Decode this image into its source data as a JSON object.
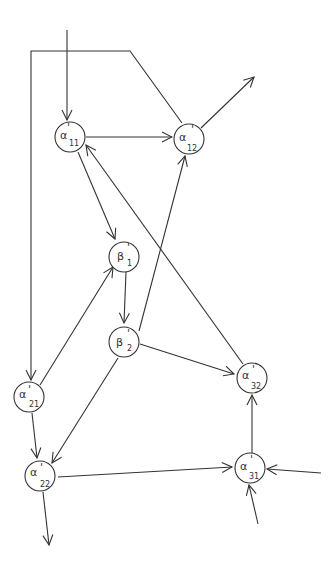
{
  "diagram": {
    "type": "directed-graph",
    "nodes": [
      {
        "id": "a11",
        "symbol": "α",
        "prime": "'",
        "sub": "11",
        "x": 70,
        "y": 137
      },
      {
        "id": "a12",
        "symbol": "α",
        "prime": "'",
        "sub": "12",
        "x": 189,
        "y": 139
      },
      {
        "id": "b1",
        "symbol": "β",
        "prime": "'",
        "sub": "1",
        "x": 124,
        "y": 257
      },
      {
        "id": "b2",
        "symbol": "β",
        "prime": "'",
        "sub": "2",
        "x": 124,
        "y": 342
      },
      {
        "id": "a21",
        "symbol": "α",
        "prime": "'",
        "sub": "21",
        "x": 29,
        "y": 397
      },
      {
        "id": "a22",
        "symbol": "α",
        "prime": "'",
        "sub": "22",
        "x": 40,
        "y": 476
      },
      {
        "id": "a32",
        "symbol": "α",
        "prime": "'",
        "sub": "32",
        "x": 252,
        "y": 378
      },
      {
        "id": "a31",
        "symbol": "α",
        "prime": "'",
        "sub": "31",
        "x": 250,
        "y": 468
      }
    ],
    "edges": [
      {
        "from": "external-top",
        "to": "a11"
      },
      {
        "from": "a11",
        "to": "a12"
      },
      {
        "from": "a11",
        "to": "b1"
      },
      {
        "from": "a32",
        "to": "a11"
      },
      {
        "from": "a12",
        "to": "external-out"
      },
      {
        "from": "a12",
        "to": "a21",
        "via": "top-left-loop"
      },
      {
        "from": "b2",
        "to": "a12"
      },
      {
        "from": "b1",
        "to": "b2"
      },
      {
        "from": "a21",
        "to": "b1"
      },
      {
        "from": "b2",
        "to": "a32"
      },
      {
        "from": "b2",
        "to": "a22"
      },
      {
        "from": "a21",
        "to": "a22"
      },
      {
        "from": "a22",
        "to": "external-bottom"
      },
      {
        "from": "a22",
        "to": "a31"
      },
      {
        "from": "a31",
        "to": "a32"
      },
      {
        "from": "external-right",
        "to": "a31"
      },
      {
        "from": "external-bottom-right",
        "to": "a31"
      }
    ]
  }
}
